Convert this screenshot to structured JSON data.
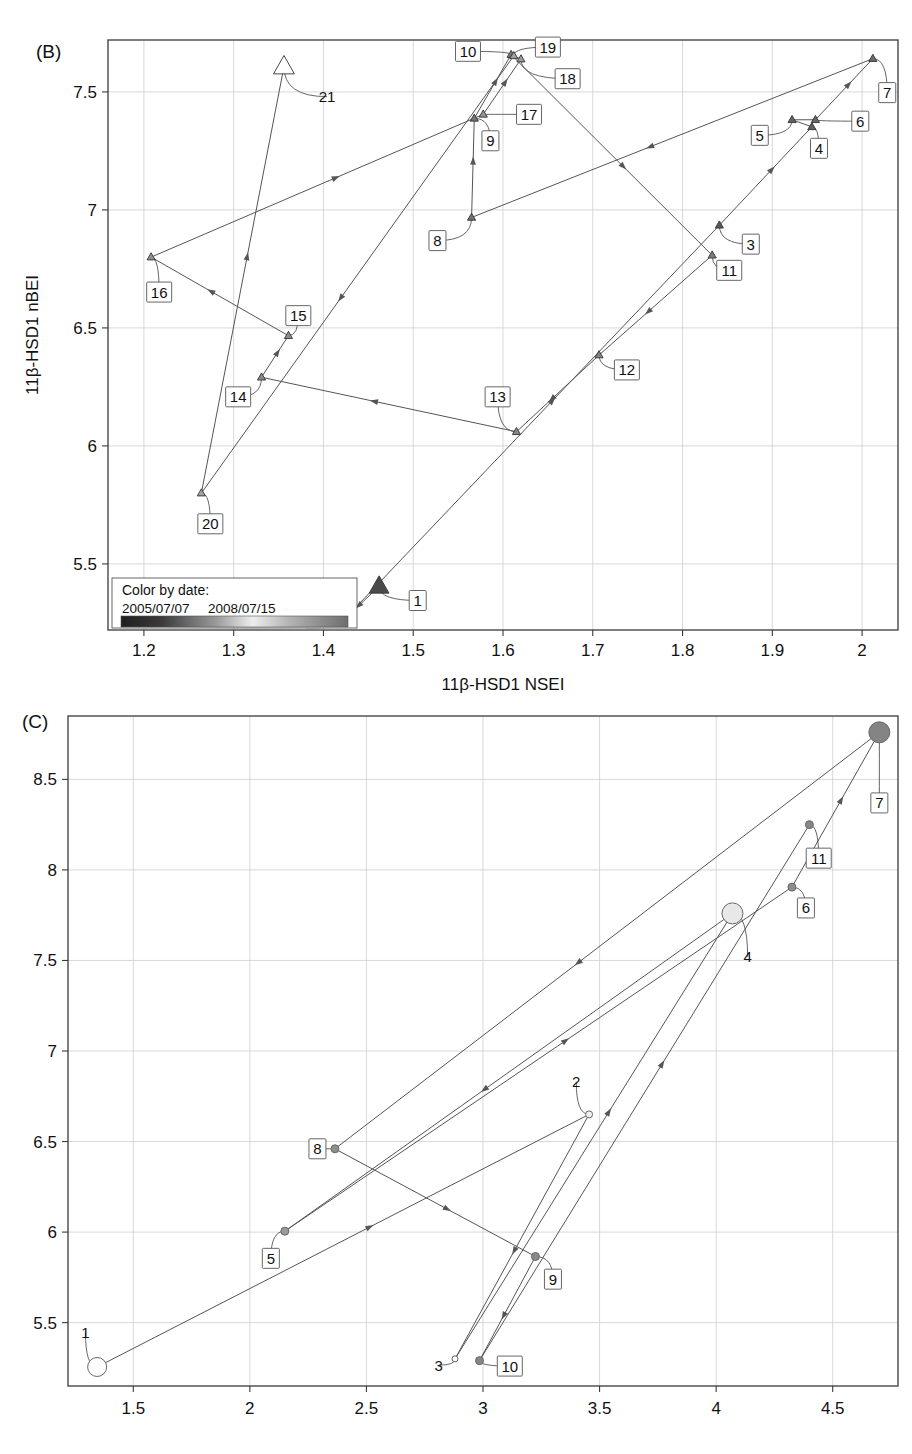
{
  "figure": {
    "panels": [
      {
        "id": "B",
        "letter": "(B)",
        "xlabel": "11β-HSD1 NSEI",
        "ylabel": "11β-HSD1 nBEI",
        "legend": {
          "title": "Color by date:",
          "start_date": "2005/07/07",
          "end_date": "2008/07/15"
        }
      },
      {
        "id": "C",
        "letter": "(C)",
        "xlabel": "",
        "ylabel": ""
      }
    ]
  },
  "chart_data": [
    {
      "type": "scatter",
      "panel": "B",
      "title": "(B)",
      "xlabel": "11β-HSD1 NSEI",
      "ylabel": "11β-HSD1 nBEI",
      "xlim": [
        1.16,
        2.04
      ],
      "ylim": [
        5.22,
        7.72
      ],
      "xticks": [
        "1.2",
        "1.3",
        "1.4",
        "1.5",
        "1.6",
        "1.7",
        "1.8",
        "1.9",
        "2"
      ],
      "xtickvals": [
        1.2,
        1.3,
        1.4,
        1.5,
        1.6,
        1.7,
        1.8,
        1.9,
        2.0
      ],
      "yticks": [
        "5.5",
        "6",
        "6.5",
        "7",
        "7.5"
      ],
      "ytickvals": [
        5.5,
        6.0,
        6.5,
        7.0,
        7.5
      ],
      "grid": true,
      "marker": "triangle",
      "color_scale": "dark to light by date",
      "legend_position": "bottom-left inside axes",
      "points": [
        {
          "label": "1",
          "x": 1.462,
          "y": 5.405,
          "size": 17,
          "shade": "#4a4a4a",
          "lx": 1.505,
          "ly": 5.345
        },
        {
          "label": "2",
          "x": 1.424,
          "y": 5.268,
          "size": 7,
          "shade": "#4f4f4f",
          "lx": 1.389,
          "ly": 5.272
        },
        {
          "label": "3",
          "x": 1.841,
          "y": 6.935,
          "size": 7,
          "shade": "#5a5a5a",
          "lx": 1.876,
          "ly": 6.855
        },
        {
          "label": "4",
          "x": 1.944,
          "y": 7.352,
          "size": 7,
          "shade": "#5e5e5e",
          "lx": 1.952,
          "ly": 7.261
        },
        {
          "label": "5",
          "x": 1.922,
          "y": 7.382,
          "size": 7,
          "shade": "#636363",
          "lx": 1.886,
          "ly": 7.316
        },
        {
          "label": "6",
          "x": 1.948,
          "y": 7.382,
          "size": 7,
          "shade": "#676767",
          "lx": 1.998,
          "ly": 7.376
        },
        {
          "label": "7",
          "x": 2.012,
          "y": 7.641,
          "size": 7,
          "shade": "#6b6b6b",
          "lx": 2.028,
          "ly": 7.497
        },
        {
          "label": "8",
          "x": 1.565,
          "y": 6.968,
          "size": 7,
          "shade": "#707070",
          "lx": 1.527,
          "ly": 6.87
        },
        {
          "label": "9",
          "x": 1.568,
          "y": 7.388,
          "size": 7,
          "shade": "#747474",
          "lx": 1.586,
          "ly": 7.293
        },
        {
          "label": "10",
          "x": 1.609,
          "y": 7.658,
          "size": 7,
          "shade": "#787878",
          "lx": 1.561,
          "ly": 7.672
        },
        {
          "label": "11",
          "x": 1.833,
          "y": 6.808,
          "size": 7,
          "shade": "#7c7c7c",
          "lx": 1.852,
          "ly": 6.744
        },
        {
          "label": "12",
          "x": 1.707,
          "y": 6.385,
          "size": 7,
          "shade": "#818181",
          "lx": 1.738,
          "ly": 6.322
        },
        {
          "label": "13",
          "x": 1.615,
          "y": 6.06,
          "size": 7,
          "shade": "#858585",
          "lx": 1.594,
          "ly": 6.208
        },
        {
          "label": "14",
          "x": 1.331,
          "y": 6.291,
          "size": 7,
          "shade": "#898989",
          "lx": 1.305,
          "ly": 6.208
        },
        {
          "label": "15",
          "x": 1.361,
          "y": 6.467,
          "size": 7,
          "shade": "#8d8d8d",
          "lx": 1.372,
          "ly": 6.552
        },
        {
          "label": "16",
          "x": 1.208,
          "y": 6.8,
          "size": 7,
          "shade": "#919191",
          "lx": 1.217,
          "ly": 6.652
        },
        {
          "label": "17",
          "x": 1.578,
          "y": 7.405,
          "size": 7,
          "shade": "#959595",
          "lx": 1.629,
          "ly": 7.405
        },
        {
          "label": "18",
          "x": 1.62,
          "y": 7.639,
          "size": 7,
          "shade": "#9a9a9a",
          "lx": 1.672,
          "ly": 7.556
        },
        {
          "label": "19",
          "x": 1.612,
          "y": 7.653,
          "size": 7,
          "shade": "#9e9e9e",
          "lx": 1.65,
          "ly": 7.69
        },
        {
          "label": "20",
          "x": 1.264,
          "y": 5.8,
          "size": 7,
          "shade": "#a2a2a2",
          "lx": 1.274,
          "ly": 5.67
        },
        {
          "label": "21",
          "x": 1.356,
          "y": 7.607,
          "size": 18,
          "shade": "#ffffff",
          "lx": 1.404,
          "ly": 7.48
        }
      ],
      "path_order": [
        "1",
        "2",
        "3",
        "4",
        "5",
        "6",
        "7",
        "8",
        "9",
        "10",
        "11",
        "12",
        "13",
        "14",
        "15",
        "16",
        "17",
        "18",
        "19",
        "20",
        "21"
      ]
    },
    {
      "type": "scatter",
      "panel": "C",
      "title": "(C)",
      "xlabel": "",
      "ylabel": "",
      "xlim": [
        1.22,
        4.78
      ],
      "ylim": [
        5.15,
        8.85
      ],
      "xticks": [
        "1.5",
        "2",
        "2.5",
        "3",
        "3.5",
        "4",
        "4.5"
      ],
      "xtickvals": [
        1.5,
        2.0,
        2.5,
        3.0,
        3.5,
        4.0,
        4.5
      ],
      "yticks": [
        "5.5",
        "6",
        "6.5",
        "7",
        "7.5",
        "8",
        "8.5"
      ],
      "ytickvals": [
        5.5,
        6.0,
        6.5,
        7.0,
        7.5,
        8.0,
        8.5
      ],
      "grid": true,
      "marker": "circle",
      "color_scale": "light to dark by date",
      "legend_position": "none",
      "points": [
        {
          "label": "1",
          "x": 1.345,
          "y": 5.255,
          "size": 19,
          "shade": "#ffffff",
          "lx": 1.295,
          "ly": 5.445
        },
        {
          "label": "2",
          "x": 3.455,
          "y": 6.65,
          "size": 7,
          "shade": "#f2f2f2",
          "lx": 3.4,
          "ly": 6.83
        },
        {
          "label": "3",
          "x": 2.88,
          "y": 5.3,
          "size": 6,
          "shade": "#fafafa",
          "lx": 2.81,
          "ly": 5.265
        },
        {
          "label": "4",
          "x": 4.07,
          "y": 7.76,
          "size": 21,
          "shade": "#e8e8e8",
          "lx": 4.135,
          "ly": 7.52
        },
        {
          "label": "5",
          "x": 2.15,
          "y": 6.005,
          "size": 8,
          "shade": "#9a9a9a",
          "lx": 2.09,
          "ly": 5.855
        },
        {
          "label": "6",
          "x": 4.325,
          "y": 7.905,
          "size": 8,
          "shade": "#8c8c8c",
          "lx": 4.385,
          "ly": 7.79
        },
        {
          "label": "7",
          "x": 4.7,
          "y": 8.76,
          "size": 21,
          "shade": "#848484",
          "lx": 4.7,
          "ly": 8.37
        },
        {
          "label": "8",
          "x": 2.365,
          "y": 6.46,
          "size": 8,
          "shade": "#8f8f8f",
          "lx": 2.29,
          "ly": 6.46
        },
        {
          "label": "9",
          "x": 3.225,
          "y": 5.865,
          "size": 8,
          "shade": "#8a8a8a",
          "lx": 3.3,
          "ly": 5.74
        },
        {
          "label": "10",
          "x": 2.985,
          "y": 5.29,
          "size": 8,
          "shade": "#878787",
          "lx": 3.115,
          "ly": 5.26
        },
        {
          "label": "11",
          "x": 4.4,
          "y": 8.25,
          "size": 8,
          "shade": "#868686",
          "lx": 4.44,
          "ly": 8.065
        }
      ],
      "path_order": [
        "1",
        "2",
        "3",
        "4",
        "5",
        "6",
        "7",
        "8",
        "9",
        "10",
        "11"
      ]
    }
  ]
}
